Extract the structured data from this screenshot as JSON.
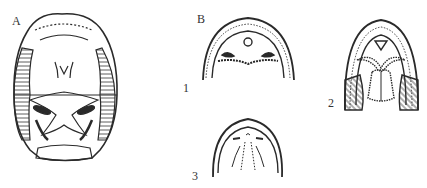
{
  "figure": {
    "panel_a": {
      "label": "A",
      "description": "Ventral view of skull/palate with hatched lateral regions"
    },
    "panel_b": {
      "label": "B",
      "subfigures": [
        {
          "label": "1",
          "description": "Palate outline with paired openings and dotted transverse ridge"
        },
        {
          "label": "2",
          "description": "Palate with V-shaped structure, paired dotted lobes and hatched sides"
        },
        {
          "label": "3",
          "description": "Palate outline with dotted midline lines"
        }
      ]
    },
    "colors": {
      "ink": "#2a2a2a",
      "background": "#ffffff"
    }
  }
}
